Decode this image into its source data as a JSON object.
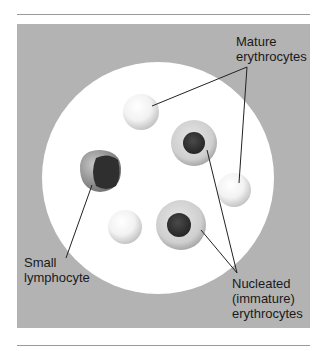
{
  "figure": {
    "panel_color": "#b3b3b3",
    "field_color": "#ffffff",
    "labels": {
      "mature": [
        "Mature",
        "erythrocytes"
      ],
      "lymphocyte": [
        "Small",
        "lymphocyte"
      ],
      "nucleated": [
        "Nucleated",
        "(immature)",
        "erythrocytes"
      ]
    },
    "cells": [
      {
        "type": "mature-erythrocyte",
        "cx": 141,
        "cy": 112,
        "r": 18
      },
      {
        "type": "mature-erythrocyte",
        "cx": 234,
        "cy": 190,
        "r": 17
      },
      {
        "type": "mature-erythrocyte",
        "cx": 125,
        "cy": 227,
        "r": 17
      },
      {
        "type": "nucleated-erythrocyte",
        "cx": 194,
        "cy": 143,
        "r": 23
      },
      {
        "type": "nucleated-erythrocyte",
        "cx": 181,
        "cy": 225,
        "r": 25
      },
      {
        "type": "small-lymphocyte",
        "cx": 100,
        "cy": 171,
        "r": 22
      }
    ]
  }
}
